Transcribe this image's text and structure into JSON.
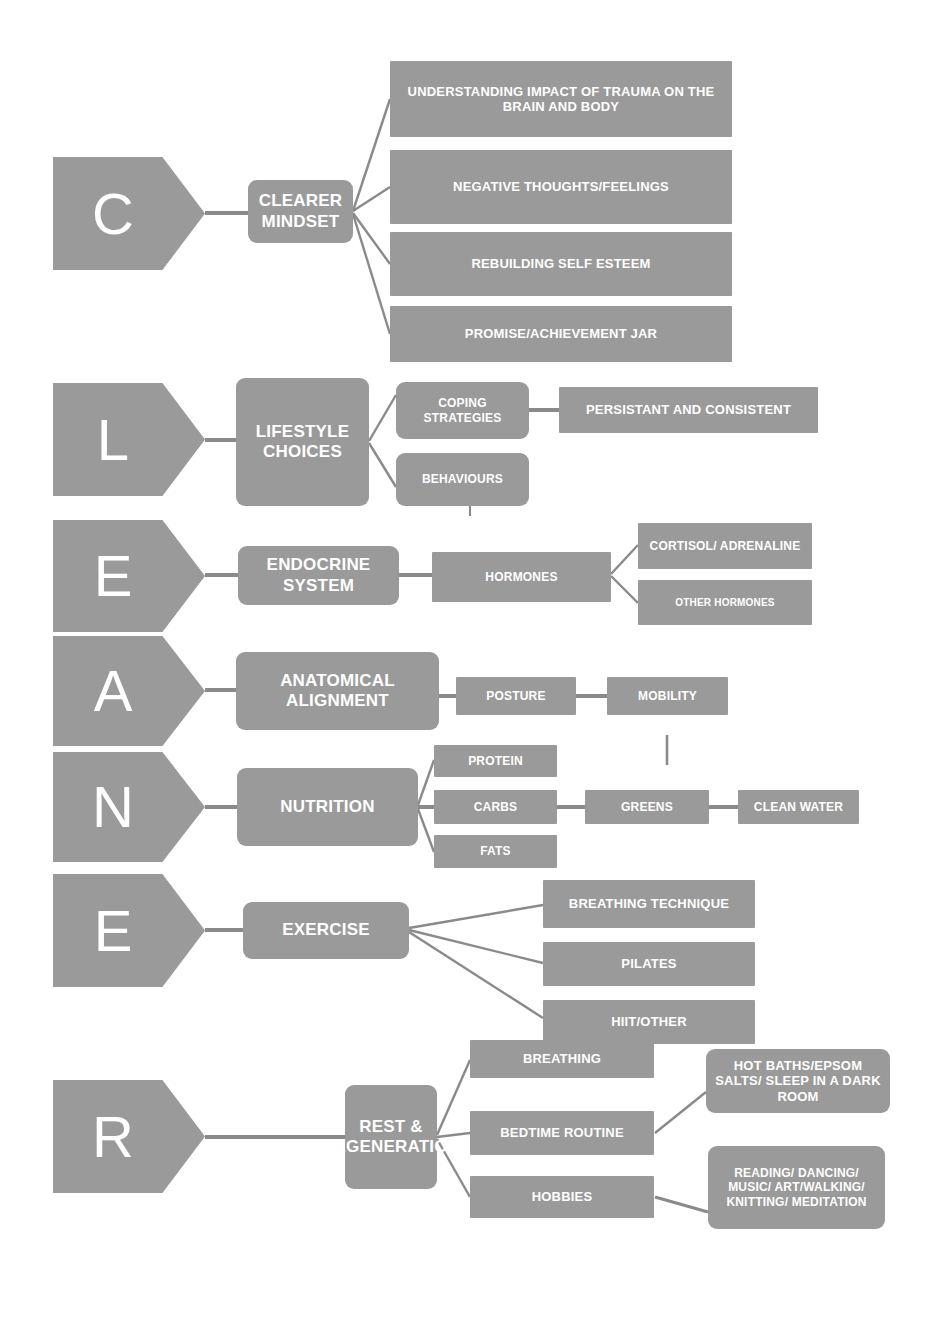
{
  "diagram": {
    "colors": {
      "node_fill": "#9a9a9a",
      "node_text": "#ffffff",
      "link": "#8a8a8a",
      "background": "#ffffff"
    },
    "letters": [
      "C",
      "L",
      "E",
      "A",
      "N",
      "E",
      "R"
    ],
    "sections": [
      {
        "letter": "C",
        "hub": "CLEARER MINDSET",
        "children": [
          "UNDERSTANDING IMPACT OF TRAUMA ON THE BRAIN AND BODY",
          "NEGATIVE THOUGHTS/FEELINGS",
          "REBUILDING SELF ESTEEM",
          "PROMISE/ACHIEVEMENT JAR"
        ]
      },
      {
        "letter": "L",
        "hub": "LIFESTYLE CHOICES",
        "children": [
          "COPING STRATEGIES",
          "BEHAVIOURS"
        ],
        "grandchildren": [
          "PERSISTANT AND CONSISTENT"
        ]
      },
      {
        "letter": "E",
        "hub": "ENDOCRINE SYSTEM",
        "children": [
          "HORMONES"
        ],
        "grandchildren": [
          "CORTISOL/ ADRENALINE",
          "OTHER HORMONES"
        ]
      },
      {
        "letter": "A",
        "hub": "ANATOMICAL ALIGNMENT",
        "children": [
          "POSTURE"
        ],
        "grandchildren": [
          "MOBILITY"
        ]
      },
      {
        "letter": "N",
        "hub": "NUTRITION",
        "children": [
          "PROTEIN",
          "CARBS",
          "FATS"
        ],
        "grandchildren": [
          "GREENS",
          "CLEAN WATER"
        ]
      },
      {
        "letter": "E",
        "hub": "EXERCISE",
        "children": [
          "BREATHING TECHNIQUE",
          "PILATES",
          "HIIT/OTHER"
        ]
      },
      {
        "letter": "R",
        "hub": "REST & REGENERATION",
        "children": [
          "BREATHING",
          "BEDTIME ROUTINE",
          "HOBBIES"
        ],
        "grandchildren": [
          "HOT BATHS/EPSOM SALTS/ SLEEP IN A DARK ROOM",
          "READING/ DANCING/ MUSIC/ ART/WALKING/ KNITTING/ MEDITATION"
        ]
      }
    ]
  },
  "nodes": {
    "letter_c": "C",
    "letter_l": "L",
    "letter_e1": "E",
    "letter_a": "A",
    "letter_n": "N",
    "letter_e2": "E",
    "letter_r": "R",
    "hub_clearer_mindset": "CLEARER MINDSET",
    "hub_lifestyle_choices": "LIFESTYLE CHOICES",
    "hub_endocrine_system": "ENDOCRINE SYSTEM",
    "hub_anatomical_alignment": "ANATOMICAL ALIGNMENT",
    "hub_nutrition": "NUTRITION",
    "hub_exercise": "EXERCISE",
    "hub_rest_regeneration": "REST & REGENERATION",
    "c_understanding": "UNDERSTANDING IMPACT OF TRAUMA ON THE BRAIN AND BODY",
    "c_negative": "NEGATIVE THOUGHTS/FEELINGS",
    "c_rebuilding": "REBUILDING SELF ESTEEM",
    "c_promise": "PROMISE/ACHIEVEMENT JAR",
    "l_coping": "COPING STRATEGIES",
    "l_behaviours": "BEHAVIOURS",
    "l_persistant": "PERSISTANT AND CONSISTENT",
    "e_hormones": "HORMONES",
    "e_cortisol": "CORTISOL/ ADRENALINE",
    "e_other_hormones": "OTHER HORMONES",
    "a_posture": "POSTURE",
    "a_mobility": "MOBILITY",
    "n_protein": "PROTEIN",
    "n_carbs": "CARBS",
    "n_fats": "FATS",
    "n_greens": "GREENS",
    "n_clean_water": "CLEAN WATER",
    "ex_breathing_technique": "BREATHING TECHNIQUE",
    "ex_pilates": "PILATES",
    "ex_hiit": "HIIT/OTHER",
    "r_breathing": "BREATHING",
    "r_bedtime": "BEDTIME ROUTINE",
    "r_hobbies": "HOBBIES",
    "r_hot_baths": "HOT BATHS/EPSOM SALTS/ SLEEP IN A DARK ROOM",
    "r_reading": "READING/ DANCING/ MUSIC/ ART/WALKING/ KNITTING/ MEDITATION"
  }
}
